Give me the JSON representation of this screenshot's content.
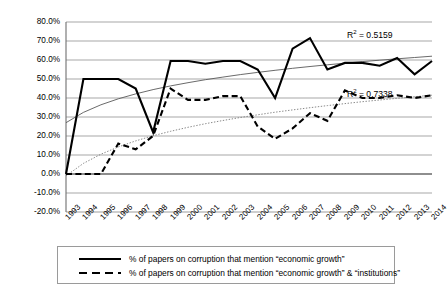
{
  "chart_data": {
    "type": "line",
    "title": "",
    "xlabel": "",
    "ylabel": "",
    "ylim": [
      -20,
      80
    ],
    "ytick_labels": [
      "80.0%",
      "70.0%",
      "60.0%",
      "50.0%",
      "40.0%",
      "30.0%",
      "20.0%",
      "10.0%",
      "0.0%",
      "-10.0%",
      "-20.0%"
    ],
    "ytick_values": [
      80,
      70,
      60,
      50,
      40,
      30,
      20,
      10,
      0,
      -10,
      -20
    ],
    "grid": true,
    "legend_position": "bottom",
    "categories": [
      "1993",
      "1994",
      "1995",
      "1996",
      "1997",
      "1998",
      "1999",
      "2000",
      "2001",
      "2002",
      "2003",
      "2004",
      "2005",
      "2006",
      "2007",
      "2008",
      "2009",
      "2010",
      "2011",
      "2012",
      "2013",
      "2014"
    ],
    "series": [
      {
        "name": "% of papers on corruption that mention \"economic growth\"",
        "style": "solid",
        "color": "#000000",
        "values": [
          0,
          50,
          50,
          50,
          45,
          22,
          59.5,
          59.5,
          58,
          59.5,
          59.5,
          55,
          40,
          66,
          71.5,
          55,
          58.5,
          58.5,
          57,
          61,
          52.5,
          59.5
        ]
      },
      {
        "name": "% of papers on corruption that mention \"economic growth\" & \"institutions\"",
        "style": "dashed",
        "color": "#000000",
        "values": [
          0,
          0,
          0,
          16,
          13,
          20,
          45,
          39,
          39,
          41,
          41,
          25,
          18.5,
          24,
          32,
          28,
          44,
          40,
          40,
          41.5,
          40,
          41.5
        ]
      }
    ],
    "trendlines": [
      {
        "name": "log trendline for economic growth series",
        "style": "thin-solid",
        "color": "#595959",
        "r2_label": "R² = 0.5159",
        "r2_value": 0.5159,
        "r2_text": "R",
        "r2_exp": "2",
        "r2_rest": " = 0.5159",
        "start_value": 27,
        "end_value": 62
      },
      {
        "name": "log trendline for economic growth and institutions series",
        "style": "dotted",
        "color": "#7a7a7a",
        "r2_label": "R² = 0.7338",
        "r2_value": 0.7338,
        "r2_text": "R",
        "r2_exp": "2",
        "r2_rest": " = 0.7338",
        "start_value": -1,
        "end_value": 41.5
      }
    ]
  },
  "legend": {
    "items": [
      {
        "label": "% of papers on corruption that mention “economic growth”",
        "style": "solid"
      },
      {
        "label": "% of papers on corruption that mention “economic growth” & “institutions”",
        "style": "dashed"
      }
    ]
  }
}
